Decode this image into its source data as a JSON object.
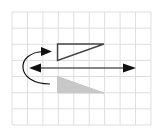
{
  "diagram": {
    "background": "#ffffff",
    "grid": {
      "x0": 12,
      "y0": 12,
      "cols": 9,
      "rows": 7,
      "cell_w": 15.44,
      "cell_h": 16.14,
      "color": "#dedede"
    },
    "shapes": {
      "original_triangle": {
        "points": "57.5,44 104,44 57.5,60.5",
        "stroke": "#444444",
        "fill": "none"
      },
      "reflected_triangle": {
        "points": "57.5,76.5 57.5,93 104,93",
        "stroke": "#c6c6c6",
        "fill": "#c8c8c8"
      },
      "mirror_line": {
        "x1": 34,
        "y1": 68,
        "x2": 131,
        "y2": 68,
        "stroke": "#111111",
        "arrowheads": "both"
      },
      "flip_arrow": {
        "path": "M 50 84 C 15 84, 15 52, 44 51.5",
        "stroke": "#111111",
        "arrowhead": "end"
      }
    }
  }
}
